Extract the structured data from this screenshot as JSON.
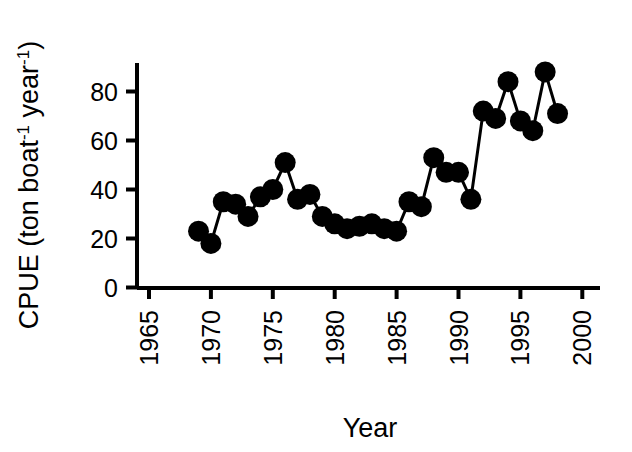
{
  "chart_data": {
    "type": "line",
    "title": "",
    "xlabel": "Year",
    "ylabel_parts": {
      "main": "CPUE (ton boat",
      "sup1": "-1",
      "mid": " year",
      "sup2": "-1",
      "tail": ")"
    },
    "ylabel": "CPUE (ton boat-1 year-1)",
    "marker": "filled-circle",
    "marker_color": "#000000",
    "line_color": "#000000",
    "grid": false,
    "legend": false,
    "xlim": [
      1965,
      2000
    ],
    "ylim": [
      0,
      92
    ],
    "xticks": [
      1965,
      1970,
      1975,
      1980,
      1985,
      1990,
      1995,
      2000
    ],
    "xtick_labels": [
      "1965",
      "1970",
      "1975",
      "1980",
      "1985",
      "1990",
      "1995",
      "2000"
    ],
    "xtick_rotation": 90,
    "yticks": [
      0,
      20,
      40,
      60,
      80
    ],
    "ytick_labels": [
      "0",
      "20",
      "40",
      "60",
      "80"
    ],
    "x": [
      1969,
      1970,
      1971,
      1972,
      1973,
      1974,
      1975,
      1976,
      1977,
      1978,
      1979,
      1980,
      1981,
      1982,
      1983,
      1984,
      1985,
      1986,
      1987,
      1988,
      1989,
      1990,
      1991,
      1992,
      1993,
      1994,
      1995,
      1996,
      1997,
      1998
    ],
    "values": [
      23,
      18,
      35,
      34,
      29,
      37,
      40,
      51,
      36,
      38,
      29,
      26,
      24,
      25,
      26,
      24,
      23,
      35,
      33,
      53,
      47,
      47,
      36,
      72,
      69,
      84,
      68,
      64,
      88,
      71
    ],
    "series": [
      {
        "name": "CPUE",
        "values": [
          23,
          18,
          35,
          34,
          29,
          37,
          40,
          51,
          36,
          38,
          29,
          26,
          24,
          25,
          26,
          24,
          23,
          35,
          33,
          53,
          47,
          47,
          36,
          72,
          69,
          84,
          68,
          64,
          88,
          71
        ]
      }
    ]
  }
}
